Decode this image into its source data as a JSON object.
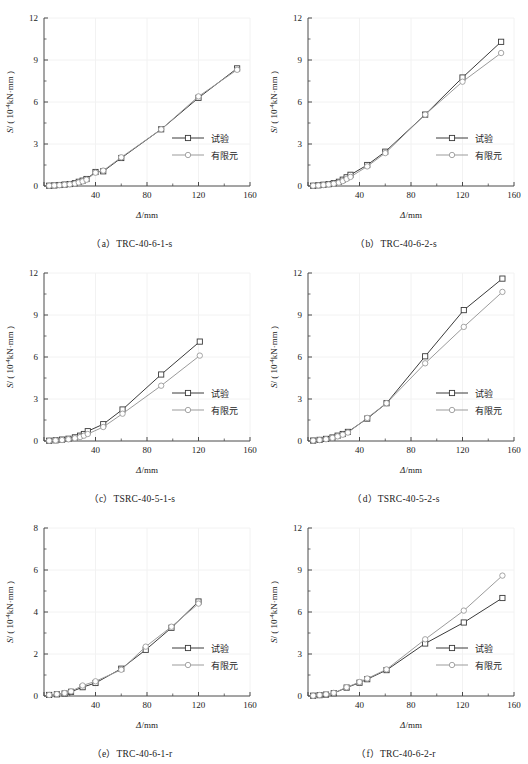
{
  "figure": {
    "panel_count": 6,
    "axis": {
      "xlabel": "Δ/mm",
      "ylabel_prefix": "S/ ( 10",
      "ylabel_exp": "-4",
      "ylabel_suffix": "kN·mm )"
    },
    "legend": {
      "test_label": "试验",
      "fe_label": "有限元"
    },
    "colors": {
      "test_line": "#3a3a3a",
      "fe_line": "#9b9b9b",
      "axis": "#4a4a4a",
      "grid": "#f2f2f2",
      "marker_fill": "#ffffff",
      "background": "#ffffff"
    }
  },
  "chart_data": [
    {
      "id": "a",
      "type": "line",
      "caption": "（a）TRC-40-6-1-s",
      "title": "TRC-40-6-1-s",
      "xlabel": "Δ/mm",
      "ylabel": "S/ ( 10-4kN·mm )",
      "xlim": [
        0,
        160
      ],
      "ylim": [
        0,
        12
      ],
      "xticks": [
        0,
        40,
        80,
        120,
        160
      ],
      "yticks": [
        0,
        3,
        6,
        9,
        12
      ],
      "xminor": [
        20,
        60,
        100,
        140
      ],
      "yminor": [
        1.5,
        4.5,
        7.5,
        10.5
      ],
      "grid": true,
      "legend_position": "lower-right",
      "series": [
        {
          "name": "试验",
          "marker": "square",
          "color": "#3a3a3a",
          "x": [
            4,
            8,
            12,
            16,
            20,
            24,
            27,
            30,
            33,
            40,
            46,
            60,
            91,
            120,
            150
          ],
          "y": [
            0.02,
            0.04,
            0.07,
            0.1,
            0.14,
            0.2,
            0.3,
            0.38,
            0.5,
            1.0,
            1.05,
            2.0,
            4.05,
            6.3,
            8.4
          ]
        },
        {
          "name": "有限元",
          "marker": "circle",
          "color": "#9b9b9b",
          "x": [
            4,
            8,
            12,
            16,
            20,
            24,
            27,
            30,
            33,
            40,
            46,
            60,
            91,
            120,
            150
          ],
          "y": [
            0.02,
            0.04,
            0.06,
            0.09,
            0.12,
            0.17,
            0.25,
            0.33,
            0.45,
            0.95,
            1.1,
            2.05,
            4.05,
            6.4,
            8.3
          ]
        }
      ]
    },
    {
      "id": "b",
      "type": "line",
      "caption": "（b）TRC-40-6-2-s",
      "title": "TRC-40-6-2-s",
      "xlabel": "Δ/mm",
      "ylabel": "S/ ( 10-4kN·mm )",
      "xlim": [
        0,
        160
      ],
      "ylim": [
        0,
        12
      ],
      "xticks": [
        0,
        40,
        80,
        120,
        160
      ],
      "yticks": [
        0,
        3,
        6,
        9,
        12
      ],
      "xminor": [
        20,
        60,
        100,
        140
      ],
      "yminor": [
        1.5,
        4.5,
        7.5,
        10.5
      ],
      "grid": true,
      "legend_position": "lower-right",
      "series": [
        {
          "name": "试验",
          "marker": "square",
          "color": "#3a3a3a",
          "x": [
            4,
            8,
            12,
            16,
            20,
            24,
            27,
            30,
            33,
            46,
            60,
            91,
            120,
            150
          ],
          "y": [
            0.02,
            0.05,
            0.09,
            0.13,
            0.2,
            0.3,
            0.45,
            0.62,
            0.8,
            1.5,
            2.45,
            5.1,
            7.75,
            10.3
          ]
        },
        {
          "name": "有限元",
          "marker": "circle",
          "color": "#9b9b9b",
          "x": [
            4,
            8,
            12,
            16,
            20,
            24,
            27,
            30,
            33,
            46,
            60,
            91,
            120,
            150
          ],
          "y": [
            0.02,
            0.04,
            0.07,
            0.11,
            0.16,
            0.24,
            0.35,
            0.5,
            0.65,
            1.4,
            2.35,
            5.1,
            7.45,
            9.5
          ]
        }
      ]
    },
    {
      "id": "c",
      "type": "line",
      "caption": "（c）TSRC-40-5-1-s",
      "title": "TSRC-40-5-1-s",
      "xlabel": "Δ/mm",
      "ylabel": "S/ ( 10-4kN·mm )",
      "xlim": [
        0,
        160
      ],
      "ylim": [
        0,
        12
      ],
      "xticks": [
        0,
        40,
        80,
        120,
        160
      ],
      "yticks": [
        0,
        3,
        6,
        9,
        12
      ],
      "xminor": [
        20,
        60,
        100,
        140
      ],
      "yminor": [
        1.5,
        4.5,
        7.5,
        10.5
      ],
      "grid": true,
      "legend_position": "lower-right",
      "series": [
        {
          "name": "试验",
          "marker": "square",
          "color": "#3a3a3a",
          "x": [
            4,
            9,
            14,
            19,
            24,
            28,
            31,
            34,
            46,
            61,
            91,
            121
          ],
          "y": [
            0.02,
            0.05,
            0.1,
            0.16,
            0.26,
            0.38,
            0.5,
            0.7,
            1.2,
            2.25,
            4.75,
            7.1
          ]
        },
        {
          "name": "有限元",
          "marker": "circle",
          "color": "#9b9b9b",
          "x": [
            4,
            9,
            14,
            19,
            24,
            28,
            31,
            34,
            46,
            61,
            91,
            121
          ],
          "y": [
            0.02,
            0.04,
            0.07,
            0.12,
            0.2,
            0.28,
            0.38,
            0.5,
            1.0,
            1.95,
            3.95,
            6.1
          ]
        }
      ]
    },
    {
      "id": "d",
      "type": "line",
      "caption": "（d）TSRC-40-5-2-s",
      "title": "TSRC-40-5-2-s",
      "xlabel": "Δ/mm",
      "ylabel": "S/ ( 10-4kN·mm )",
      "xlim": [
        0,
        160
      ],
      "ylim": [
        0,
        12
      ],
      "xticks": [
        0,
        40,
        80,
        120,
        160
      ],
      "yticks": [
        0,
        3,
        6,
        9,
        12
      ],
      "xminor": [
        20,
        60,
        100,
        140
      ],
      "yminor": [
        1.5,
        4.5,
        7.5,
        10.5
      ],
      "grid": true,
      "legend_position": "lower-right",
      "series": [
        {
          "name": "试验",
          "marker": "square",
          "color": "#3a3a3a",
          "x": [
            4,
            9,
            14,
            19,
            23,
            27,
            31,
            46,
            61,
            91,
            121,
            151
          ],
          "y": [
            0.03,
            0.08,
            0.15,
            0.25,
            0.38,
            0.5,
            0.65,
            1.6,
            2.7,
            6.05,
            9.35,
            11.6
          ]
        },
        {
          "name": "有限元",
          "marker": "circle",
          "color": "#9b9b9b",
          "x": [
            4,
            9,
            14,
            19,
            23,
            27,
            31,
            46,
            61,
            91,
            121,
            151
          ],
          "y": [
            0.03,
            0.07,
            0.13,
            0.22,
            0.33,
            0.45,
            0.6,
            1.65,
            2.7,
            5.55,
            8.15,
            10.65
          ]
        }
      ]
    },
    {
      "id": "e",
      "type": "line",
      "caption": "（e）TRC-40-6-1-r",
      "title": "TRC-40-6-1-r",
      "xlabel": "Δ/mm",
      "ylabel": "S/ ( 10-4kN·mm )",
      "xlim": [
        0,
        160
      ],
      "ylim": [
        0,
        8
      ],
      "xticks": [
        0,
        40,
        80,
        120,
        160
      ],
      "yticks": [
        0,
        2,
        4,
        6,
        8
      ],
      "xminor": [
        20,
        60,
        100,
        140
      ],
      "yminor": [
        1,
        3,
        5,
        7
      ],
      "grid": true,
      "legend_position": "lower-right",
      "series": [
        {
          "name": "试验",
          "marker": "square",
          "color": "#3a3a3a",
          "x": [
            4,
            10,
            16,
            21,
            30,
            40,
            60,
            79,
            99,
            120
          ],
          "y": [
            0.05,
            0.08,
            0.12,
            0.2,
            0.42,
            0.62,
            1.3,
            2.2,
            3.25,
            4.5
          ]
        },
        {
          "name": "有限元",
          "marker": "circle",
          "color": "#9b9b9b",
          "x": [
            4,
            10,
            16,
            21,
            30,
            40,
            60,
            79,
            99,
            120
          ],
          "y": [
            0.05,
            0.09,
            0.14,
            0.22,
            0.5,
            0.7,
            1.25,
            2.35,
            3.3,
            4.4
          ]
        }
      ]
    },
    {
      "id": "f",
      "type": "line",
      "caption": "（f）TRC-40-6-2-r",
      "title": "TRC-40-6-2-r",
      "xlabel": "Δ/mm",
      "ylabel": "S/ ( 10-4kN·mm )",
      "xlim": [
        0,
        160
      ],
      "ylim": [
        0,
        12
      ],
      "xticks": [
        0,
        40,
        80,
        120,
        160
      ],
      "yticks": [
        0,
        3,
        6,
        9,
        12
      ],
      "xminor": [
        20,
        60,
        100,
        140
      ],
      "yminor": [
        1.5,
        4.5,
        7.5,
        10.5
      ],
      "grid": true,
      "legend_position": "lower-right",
      "series": [
        {
          "name": "试验",
          "marker": "square",
          "color": "#3a3a3a",
          "x": [
            4,
            9,
            14,
            20,
            30,
            40,
            46,
            61,
            91,
            121,
            151
          ],
          "y": [
            0.02,
            0.06,
            0.1,
            0.2,
            0.6,
            0.95,
            1.2,
            1.85,
            3.75,
            5.25,
            7.0
          ]
        },
        {
          "name": "有限元",
          "marker": "circle",
          "color": "#9b9b9b",
          "x": [
            4,
            9,
            14,
            20,
            30,
            40,
            46,
            61,
            91,
            121,
            151
          ],
          "y": [
            0.02,
            0.07,
            0.12,
            0.22,
            0.62,
            1.0,
            1.25,
            1.9,
            4.05,
            6.1,
            8.6
          ]
        }
      ]
    }
  ]
}
